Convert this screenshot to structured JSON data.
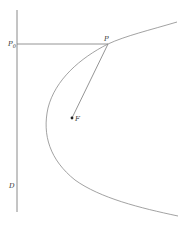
{
  "diagram": {
    "type": "parabola-focus-directrix",
    "labels": {
      "directrix": "D",
      "point": "P",
      "foot": "P",
      "foot_subscript": "0",
      "focus": "F"
    },
    "colors": {
      "line": "#7a7a7a",
      "curve": "#8a8a8a",
      "text": "#333333",
      "point": "#222222"
    }
  }
}
